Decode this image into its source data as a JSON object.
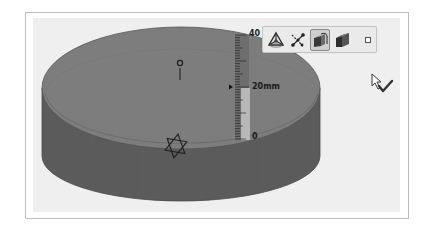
{
  "viewport": {
    "background": "#efefef",
    "frame_border": "#bdbdbd"
  },
  "model": {
    "type": "cylinder-extrusion",
    "top_face_color": "#7d7d7d",
    "side_face_color": "#5b5b5b",
    "edge_color": "#3a3a3a"
  },
  "ruler": {
    "label_max": "40",
    "label_min": "0",
    "label_current": "20mm",
    "value": 20,
    "unit": "mm",
    "range": [
      0,
      40
    ]
  },
  "context_toolbar": {
    "items": [
      {
        "icon": "triad-icon",
        "label": "Triad",
        "selected": false
      },
      {
        "icon": "sketch-relations-icon",
        "label": "Relations",
        "selected": false
      },
      {
        "icon": "extrude-icon",
        "label": "Extrude",
        "selected": true
      },
      {
        "icon": "solid-face-icon",
        "label": "Solid",
        "selected": false
      },
      {
        "icon": "small-square-icon",
        "label": "More",
        "selected": false
      }
    ]
  },
  "cursor": {
    "icon": "arrow-checkmark-cursor-icon"
  }
}
